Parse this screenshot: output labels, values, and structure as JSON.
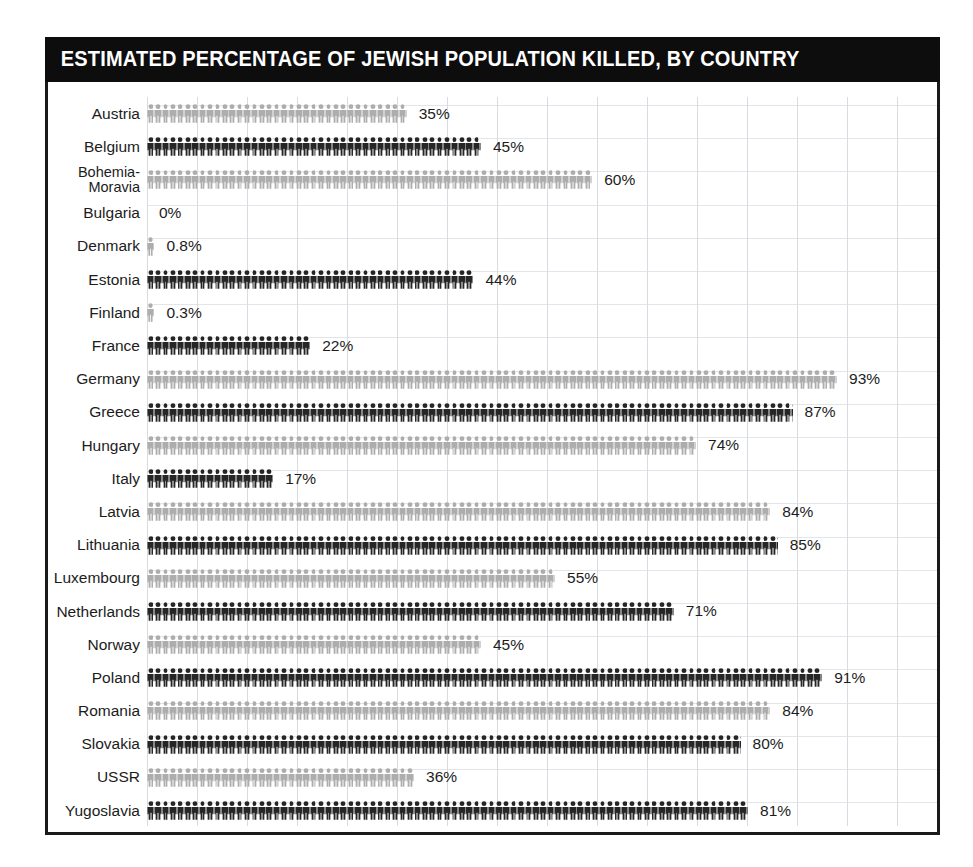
{
  "header": {
    "title": "ESTIMATED PERCENTAGE OF JEWISH POPULATION KILLED, BY COUNTRY",
    "background_color": "#0d0d0d",
    "text_color": "#ffffff"
  },
  "colors": {
    "dark_pictogram": "#262626",
    "light_pictogram": "#adadad",
    "gridline": "#d8dce0",
    "frame": "#1a1a1a",
    "page_background": "#ffffff"
  },
  "chart_data": {
    "type": "bar",
    "title": "ESTIMATED PERCENTAGE OF JEWISH POPULATION KILLED, BY COUNTRY",
    "xlabel": "",
    "ylabel": "",
    "xlim": [
      0,
      100
    ],
    "grid": true,
    "legend_position": "none",
    "unit": "%",
    "pictogram": "person-icon",
    "categories": [
      "Austria",
      "Belgium",
      "Bohemia-\nMoravia",
      "Bulgaria",
      "Denmark",
      "Estonia",
      "Finland",
      "France",
      "Germany",
      "Greece",
      "Hungary",
      "Italy",
      "Latvia",
      "Lithuania",
      "Luxembourg",
      "Netherlands",
      "Norway",
      "Poland",
      "Romania",
      "Slovakia",
      "USSR",
      "Yugoslavia"
    ],
    "values": [
      35,
      45,
      60,
      0,
      0.8,
      44,
      0.3,
      22,
      93,
      87,
      74,
      17,
      84,
      85,
      55,
      71,
      45,
      91,
      84,
      80,
      36,
      81
    ],
    "labels": [
      "35%",
      "45%",
      "60%",
      "0%",
      "0.8%",
      "44%",
      "0.3%",
      "22%",
      "93%",
      "87%",
      "74%",
      "17%",
      "84%",
      "85%",
      "55%",
      "71%",
      "45%",
      "91%",
      "84%",
      "80%",
      "36%",
      "81%"
    ]
  },
  "rows": [
    {
      "country": "Austria",
      "value": 35,
      "label": "35%",
      "shade": "light",
      "two_line": false
    },
    {
      "country": "Belgium",
      "value": 45,
      "label": "45%",
      "shade": "dark",
      "two_line": false
    },
    {
      "country": "Bohemia-\nMoravia",
      "value": 60,
      "label": "60%",
      "shade": "light",
      "two_line": true
    },
    {
      "country": "Bulgaria",
      "value": 0,
      "label": "0%",
      "shade": "dark",
      "two_line": false
    },
    {
      "country": "Denmark",
      "value": 0.8,
      "label": "0.8%",
      "shade": "light",
      "two_line": false
    },
    {
      "country": "Estonia",
      "value": 44,
      "label": "44%",
      "shade": "dark",
      "two_line": false
    },
    {
      "country": "Finland",
      "value": 0.3,
      "label": "0.3%",
      "shade": "light",
      "two_line": false
    },
    {
      "country": "France",
      "value": 22,
      "label": "22%",
      "shade": "dark",
      "two_line": false
    },
    {
      "country": "Germany",
      "value": 93,
      "label": "93%",
      "shade": "light",
      "two_line": false
    },
    {
      "country": "Greece",
      "value": 87,
      "label": "87%",
      "shade": "dark",
      "two_line": false
    },
    {
      "country": "Hungary",
      "value": 74,
      "label": "74%",
      "shade": "light",
      "two_line": false
    },
    {
      "country": "Italy",
      "value": 17,
      "label": "17%",
      "shade": "dark",
      "two_line": false
    },
    {
      "country": "Latvia",
      "value": 84,
      "label": "84%",
      "shade": "light",
      "two_line": false
    },
    {
      "country": "Lithuania",
      "value": 85,
      "label": "85%",
      "shade": "dark",
      "two_line": false
    },
    {
      "country": "Luxembourg",
      "value": 55,
      "label": "55%",
      "shade": "light",
      "two_line": false
    },
    {
      "country": "Netherlands",
      "value": 71,
      "label": "71%",
      "shade": "dark",
      "two_line": false
    },
    {
      "country": "Norway",
      "value": 45,
      "label": "45%",
      "shade": "light",
      "two_line": false
    },
    {
      "country": "Poland",
      "value": 91,
      "label": "91%",
      "shade": "dark",
      "two_line": false
    },
    {
      "country": "Romania",
      "value": 84,
      "label": "84%",
      "shade": "light",
      "two_line": false
    },
    {
      "country": "Slovakia",
      "value": 80,
      "label": "80%",
      "shade": "dark",
      "two_line": false
    },
    {
      "country": "USSR",
      "value": 36,
      "label": "36%",
      "shade": "light",
      "two_line": false
    },
    {
      "country": "Yugoslavia",
      "value": 81,
      "label": "81%",
      "shade": "dark",
      "two_line": false
    }
  ],
  "scale": {
    "px_per_percent": 7.42,
    "bar_origin_x": 99
  }
}
